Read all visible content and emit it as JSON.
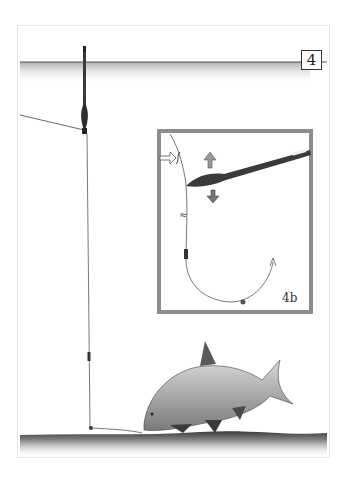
{
  "figure": {
    "label": "4",
    "inset_label": "4b",
    "colors": {
      "line": "#3a3a3a",
      "water": "#bdbdbd",
      "inset_border": "#8c8c8c",
      "float": "#2a2a2a",
      "fish": "#9a9a9a"
    }
  }
}
